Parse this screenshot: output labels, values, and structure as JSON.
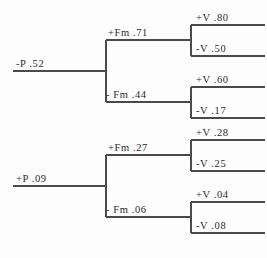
{
  "figure": {
    "type": "binary-decision-tree-diagram",
    "background_color": "#fdfdfd",
    "line_color": "#4a4a4a",
    "text_color": "#2b2b2b"
  },
  "trees": [
    {
      "id": "upper-tree",
      "root": {
        "label": "-P .52"
      },
      "internal": [
        {
          "label": "+Fm .71"
        },
        {
          "label": "- Fm .44"
        }
      ],
      "leaves": [
        {
          "label": "+V .80"
        },
        {
          "label": "-V .50"
        },
        {
          "label": "+V .60"
        },
        {
          "label": "-V .17"
        }
      ]
    },
    {
      "id": "lower-tree",
      "root": {
        "label": "+P .09"
      },
      "internal": [
        {
          "label": "+Fm .27"
        },
        {
          "label": "- Fm .06"
        }
      ],
      "leaves": [
        {
          "label": "+V .28"
        },
        {
          "label": "-V .25"
        },
        {
          "label": "+V .04"
        },
        {
          "label": "-V .08"
        }
      ]
    }
  ]
}
